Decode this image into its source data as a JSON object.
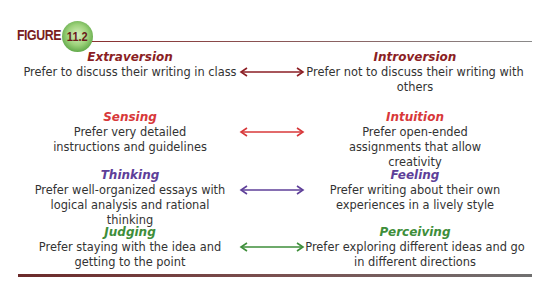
{
  "figure": {
    "label": "FIGURE",
    "number": "11.2"
  },
  "colors": {
    "extraversion_introversion": "#8b1e24",
    "sensing_intuition": "#d8383a",
    "thinking_feeling": "#5e3f99",
    "judging_perceiving": "#3e8e3a",
    "figure_label": "#7a1d1d",
    "badge_green": "#6bb04c"
  },
  "pairs": [
    {
      "left": {
        "term": "Extraversion",
        "desc": "Prefer to discuss their writing in class"
      },
      "right": {
        "term": "Introversion",
        "desc": "Prefer not to discuss their writing with others"
      }
    },
    {
      "left": {
        "term": "Sensing",
        "desc": "Prefer very detailed instructions and guidelines"
      },
      "right": {
        "term": "Intuition",
        "desc": "Prefer open-ended assignments that allow creativity"
      }
    },
    {
      "left": {
        "term": "Thinking",
        "desc": "Prefer well-organized essays with logical analysis and rational thinking"
      },
      "right": {
        "term": "Feeling",
        "desc": "Prefer writing about their own experiences in a lively style"
      }
    },
    {
      "left": {
        "term": "Judging",
        "desc": "Prefer staying with the idea and getting to the point"
      },
      "right": {
        "term": "Perceiving",
        "desc": "Prefer exploring different ideas and go in different directions"
      }
    }
  ]
}
